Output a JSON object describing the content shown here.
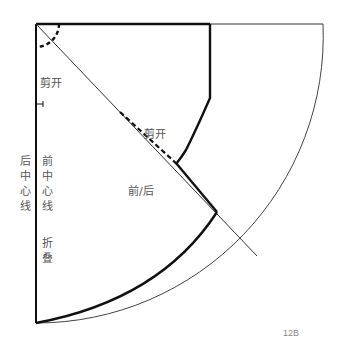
{
  "diagram": {
    "type": "sewing-pattern",
    "labels": {
      "cut_top": "剪开",
      "cut_mid": "剪开",
      "front_back": "前/后",
      "back_center_line": "后中心线",
      "front_center_line": "前中心线",
      "fold": "折叠"
    },
    "figure_number": "12B",
    "colors": {
      "line": "#111111",
      "thin_line": "#555555",
      "text": "#555555",
      "caption": "#888888"
    }
  }
}
